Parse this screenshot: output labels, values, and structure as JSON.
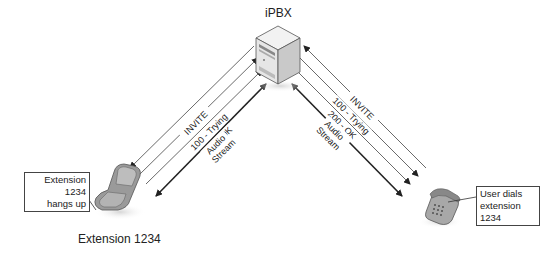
{
  "diagram": {
    "server": {
      "label": "iPBX",
      "icon": "server-tower-icon"
    },
    "left_device": {
      "label": "Extension 1234",
      "icon": "cell-phone-icon",
      "callout": [
        "Extension 1234",
        "hangs up"
      ]
    },
    "right_device": {
      "icon": "desk-phone-icon",
      "callout": [
        "User dials",
        "extension 1234"
      ]
    },
    "left_link_messages": [
      {
        "label": "INVITE",
        "direction": "to-phone"
      },
      {
        "label": "100 - Trying",
        "direction": "to-server"
      },
      {
        "label": "200 - OK",
        "direction": "to-server"
      },
      {
        "label": "Audio Stream",
        "label_lines": [
          "Audio",
          "Stream"
        ],
        "direction": "bidirectional"
      }
    ],
    "right_link_messages": [
      {
        "label": "INVITE",
        "direction": "to-server"
      },
      {
        "label": "100 - Trying",
        "direction": "to-phone"
      },
      {
        "label": "200 - OK",
        "direction": "to-phone"
      },
      {
        "label": "Audio Stream",
        "label_lines": [
          "Audio",
          "Stream"
        ],
        "direction": "bidirectional"
      }
    ],
    "colors": {
      "line": "#333333",
      "text": "#222222",
      "background": "#ffffff"
    }
  }
}
